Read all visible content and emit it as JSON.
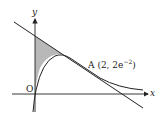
{
  "diagram": {
    "axes": {
      "x_label": "x",
      "y_label": "y",
      "origin_label": "O"
    },
    "point_A": {
      "label": "A",
      "coords": "(2, 2e",
      "exponent": "−2",
      "close": ")"
    },
    "elements": [
      "curve",
      "tangent line at A",
      "shaded region between y-axis, tangent and curve"
    ],
    "colors": {
      "stroke": "#222222",
      "shade": "#b8b8b8",
      "background": "#ffffff"
    }
  }
}
